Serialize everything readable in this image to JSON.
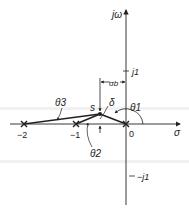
{
  "diagram": {
    "type": "s-plane pole diagram",
    "axes": {
      "imag_axis_label": "jω",
      "real_axis_label": "σ",
      "origin_label": "0",
      "imag_ticks": [
        "j1",
        "−j1"
      ],
      "real_ticks": [
        "−2",
        "−1"
      ]
    },
    "poles": [
      {
        "label": "0",
        "re": 0,
        "im": 0
      },
      {
        "label": "−1",
        "re": -1,
        "im": 0
      },
      {
        "label": "−2",
        "re": -2,
        "im": 0
      }
    ],
    "test_point": {
      "label": "s"
    },
    "angle_labels": {
      "theta1": "θ1",
      "theta2": "θ2",
      "theta3": "θ3",
      "delta": "δ"
    },
    "dimension_label": "σb",
    "colors": {
      "line": "#222222",
      "background": "#ffffff",
      "scan_band": "#f1f1f1"
    }
  }
}
